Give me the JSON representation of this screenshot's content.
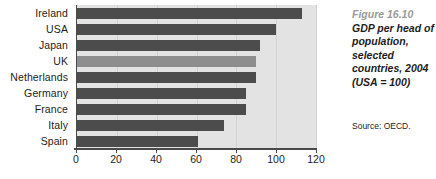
{
  "chart_data": {
    "type": "bar",
    "orientation": "horizontal",
    "xlabel": "",
    "ylabel": "",
    "xlim": [
      0,
      120
    ],
    "grid": false,
    "legend": "none",
    "categories": [
      "Ireland",
      "USA",
      "Japan",
      "UK",
      "Netherlands",
      "Germany",
      "France",
      "Italy",
      "Spain"
    ],
    "values": [
      113,
      100,
      92,
      90,
      90,
      85,
      85,
      74,
      61
    ],
    "highlight_category": "UK",
    "xticks": [
      0,
      20,
      40,
      60,
      80,
      100,
      120
    ],
    "xtick_labels": [
      "0",
      "20",
      "40",
      "60",
      "80",
      "100",
      "120"
    ],
    "bars": [
      {
        "label": "Ireland",
        "value": 113,
        "color": "#4c4c4c"
      },
      {
        "label": "USA",
        "value": 100,
        "color": "#4c4c4c"
      },
      {
        "label": "Japan",
        "value": 92,
        "color": "#4c4c4c"
      },
      {
        "label": "UK",
        "value": 90,
        "color": "#8e8e8e"
      },
      {
        "label": "Netherlands",
        "value": 90,
        "color": "#4c4c4c"
      },
      {
        "label": "Germany",
        "value": 85,
        "color": "#4c4c4c"
      },
      {
        "label": "France",
        "value": 85,
        "color": "#4c4c4c"
      },
      {
        "label": "Italy",
        "value": 74,
        "color": "#4c4c4c"
      },
      {
        "label": "Spain",
        "value": 61,
        "color": "#4c4c4c"
      }
    ]
  },
  "caption": {
    "figure_number": "Figure 16.10",
    "lines": [
      "GDP per head of",
      "population,",
      "selected",
      "countries, 2004",
      "(USA = 100)"
    ],
    "source": "Source: OECD."
  },
  "colors": {
    "bar_default": "#4c4c4c",
    "bar_highlight": "#8e8e8e",
    "plot_background": "#e3e3e3",
    "axis": "#4a4a4a",
    "text": "#1d1d1d",
    "figure_number": "#9a9a9a",
    "page_background": "#ffffff"
  }
}
